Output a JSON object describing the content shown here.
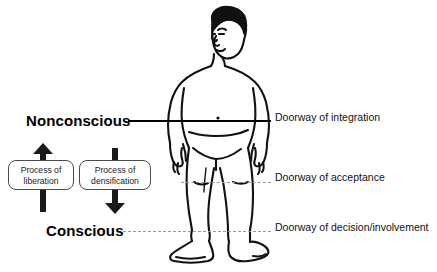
{
  "diagram": {
    "background_color": "#ffffff",
    "ink_color": "#000000",
    "guide_color": "#9a9a9a"
  },
  "levels": {
    "top_label": "Nonconscious",
    "bottom_label": "Conscious"
  },
  "doorways": [
    {
      "label": "Doorway of integration",
      "line_style": "solid"
    },
    {
      "label": "Doorway of acceptance",
      "line_style": "dashed"
    },
    {
      "label": "Doorway of decision/involvement",
      "line_style": "dashed"
    }
  ],
  "processes": [
    {
      "line1": "Process of",
      "line2": "liberation",
      "direction": "up"
    },
    {
      "line1": "Process of",
      "line2": "densification",
      "direction": "down"
    }
  ]
}
